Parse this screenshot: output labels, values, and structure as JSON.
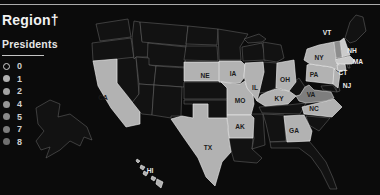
{
  "header": {
    "title": "Region†"
  },
  "legend": {
    "title": "Presidents",
    "levels": [
      {
        "label": "0",
        "fill": "none",
        "outline": "#cfcfcf"
      },
      {
        "label": "1",
        "fill": "#b0b0b0",
        "outline": "none"
      },
      {
        "label": "2",
        "fill": "#a3a3a3",
        "outline": "none"
      },
      {
        "label": "4",
        "fill": "#969696",
        "outline": "none"
      },
      {
        "label": "5",
        "fill": "#8a8a8a",
        "outline": "none"
      },
      {
        "label": "7",
        "fill": "#7d7d7d",
        "outline": "none"
      },
      {
        "label": "8",
        "fill": "#707070",
        "outline": "none"
      }
    ]
  },
  "chart_data": {
    "type": "heatmap",
    "title": "Region†",
    "legend_title": "Presidents",
    "legend_values": [
      0,
      1,
      2,
      4,
      5,
      7,
      8
    ],
    "highlighted_states": [
      "CA",
      "NE",
      "IA",
      "MO",
      "IL",
      "AR",
      "KY",
      "TX",
      "GA",
      "NC",
      "OH",
      "PA",
      "NJ",
      "NY",
      "CT",
      "MA",
      "NH",
      "VT",
      "VA",
      "HI"
    ],
    "zero_states": [
      "WA",
      "OR",
      "NV",
      "ID",
      "MT",
      "WY",
      "UT",
      "CO",
      "AZ",
      "NM",
      "ND",
      "SD",
      "MN",
      "WI",
      "MI",
      "IN",
      "KS",
      "OK",
      "LA",
      "MS",
      "AL",
      "TN",
      "SC",
      "FL",
      "WV",
      "MD",
      "DE",
      "ME",
      "RI",
      "AK"
    ]
  },
  "map": {
    "palette": {
      "none": "#121212",
      "light": "#b2b2b2",
      "lighter": "#cbcbcb",
      "medium": "#8d8d8d",
      "dark": "#7e7e7e"
    },
    "strokes": {
      "none": "#6e6e6e",
      "light": "#efefef",
      "lighter": "#f4f4f4",
      "medium": "#d9d9d9",
      "dark": "#d9d9d9"
    },
    "ink": {
      "dark": "#1c1c1c",
      "light": "#ececec"
    },
    "states": [
      {
        "id": "WA",
        "tone": "none"
      },
      {
        "id": "OR",
        "tone": "none"
      },
      {
        "id": "NV",
        "tone": "none"
      },
      {
        "id": "ID",
        "tone": "none"
      },
      {
        "id": "MT",
        "tone": "none"
      },
      {
        "id": "WY",
        "tone": "none"
      },
      {
        "id": "UT",
        "tone": "none"
      },
      {
        "id": "CO",
        "tone": "none"
      },
      {
        "id": "AZ",
        "tone": "none"
      },
      {
        "id": "NM",
        "tone": "none"
      },
      {
        "id": "ND",
        "tone": "none"
      },
      {
        "id": "SD",
        "tone": "none"
      },
      {
        "id": "MN",
        "tone": "none"
      },
      {
        "id": "WI",
        "tone": "none"
      },
      {
        "id": "MI_N",
        "tone": "none"
      },
      {
        "id": "MI_S",
        "tone": "none"
      },
      {
        "id": "IN",
        "tone": "none"
      },
      {
        "id": "KS",
        "tone": "none"
      },
      {
        "id": "OK",
        "tone": "none"
      },
      {
        "id": "LA",
        "tone": "none"
      },
      {
        "id": "MS",
        "tone": "none"
      },
      {
        "id": "AL",
        "tone": "none"
      },
      {
        "id": "TN",
        "tone": "none"
      },
      {
        "id": "SC",
        "tone": "none"
      },
      {
        "id": "FL",
        "tone": "none"
      },
      {
        "id": "WV",
        "tone": "none"
      },
      {
        "id": "MD",
        "tone": "none"
      },
      {
        "id": "DE",
        "tone": "none"
      },
      {
        "id": "ME",
        "tone": "none"
      },
      {
        "id": "RI",
        "tone": "none"
      },
      {
        "id": "AK",
        "tone": "none"
      },
      {
        "id": "CA",
        "tone": "light"
      },
      {
        "id": "NE",
        "tone": "light"
      },
      {
        "id": "IA",
        "tone": "light"
      },
      {
        "id": "MO",
        "tone": "light"
      },
      {
        "id": "IL",
        "tone": "light"
      },
      {
        "id": "AR",
        "tone": "light"
      },
      {
        "id": "KY",
        "tone": "light"
      },
      {
        "id": "TX",
        "tone": "light"
      },
      {
        "id": "GA",
        "tone": "light"
      },
      {
        "id": "NC",
        "tone": "light"
      },
      {
        "id": "OH",
        "tone": "light"
      },
      {
        "id": "PA",
        "tone": "light"
      },
      {
        "id": "NJ",
        "tone": "light"
      },
      {
        "id": "NY",
        "tone": "light"
      },
      {
        "id": "CT",
        "tone": "light"
      },
      {
        "id": "HI1",
        "tone": "light"
      },
      {
        "id": "HI2",
        "tone": "light"
      },
      {
        "id": "HI3",
        "tone": "light"
      },
      {
        "id": "HI4",
        "tone": "light"
      },
      {
        "id": "HI5",
        "tone": "light"
      },
      {
        "id": "MA",
        "tone": "lighter"
      },
      {
        "id": "NH",
        "tone": "lighter"
      },
      {
        "id": "VT",
        "tone": "medium"
      },
      {
        "id": "VA",
        "tone": "dark"
      }
    ],
    "labels": [
      {
        "text": "CA",
        "x": 103,
        "y": 100,
        "ink": "dark"
      },
      {
        "text": "NE",
        "x": 205,
        "y": 78,
        "ink": "dark"
      },
      {
        "text": "IA",
        "x": 233,
        "y": 76,
        "ink": "dark"
      },
      {
        "text": "MO",
        "x": 240,
        "y": 103,
        "ink": "dark"
      },
      {
        "text": "IL",
        "x": 255,
        "y": 90,
        "ink": "dark"
      },
      {
        "text": "AK",
        "x": 240,
        "y": 129,
        "ink": "dark"
      },
      {
        "text": "TX",
        "x": 208,
        "y": 150,
        "ink": "dark"
      },
      {
        "text": "KY",
        "x": 279,
        "y": 101,
        "ink": "dark"
      },
      {
        "text": "OH",
        "x": 285,
        "y": 82,
        "ink": "dark"
      },
      {
        "text": "PA",
        "x": 314,
        "y": 77,
        "ink": "dark"
      },
      {
        "text": "NY",
        "x": 319,
        "y": 60,
        "ink": "dark"
      },
      {
        "text": "VA",
        "x": 311,
        "y": 97,
        "ink": "dark"
      },
      {
        "text": "NC",
        "x": 314,
        "y": 111,
        "ink": "dark"
      },
      {
        "text": "GA",
        "x": 294,
        "y": 133,
        "ink": "dark"
      },
      {
        "text": "VT",
        "x": 327,
        "y": 35,
        "ink": "light"
      },
      {
        "text": "NH",
        "x": 352,
        "y": 53,
        "ink": "light"
      },
      {
        "text": "MA",
        "x": 358,
        "y": 64,
        "ink": "light"
      },
      {
        "text": "CT",
        "x": 343,
        "y": 75,
        "ink": "light"
      },
      {
        "text": "NJ",
        "x": 347,
        "y": 88,
        "ink": "light"
      },
      {
        "text": "HI",
        "x": 150,
        "y": 173,
        "ink": "light"
      }
    ]
  }
}
